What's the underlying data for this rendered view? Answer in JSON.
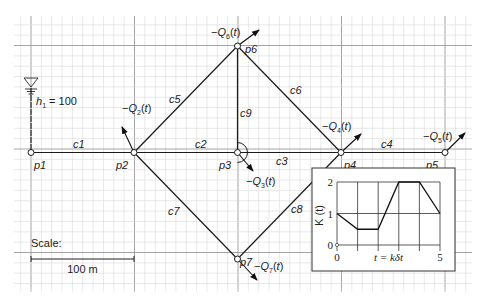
{
  "grid": {
    "x_start": 14,
    "x_end": 472,
    "y_start": 16,
    "y_end": 292,
    "minor": 10.35,
    "major_every": 10,
    "major_origin_x": 31,
    "major_origin_y": 45.5,
    "minor_color": "#d9d9d9",
    "major_color": "#9a9a9a"
  },
  "nodes": [
    {
      "id": "p1",
      "label": "p1",
      "x": 31,
      "y": 152.5,
      "lx": 34,
      "ly": 166
    },
    {
      "id": "p2",
      "label": "p2",
      "x": 134,
      "y": 152.5,
      "lx": 116,
      "ly": 166
    },
    {
      "id": "p3",
      "label": "p3",
      "x": 237.5,
      "y": 152.5,
      "lx": 219,
      "ly": 166
    },
    {
      "id": "p4",
      "label": "p4",
      "x": 341,
      "y": 152.5,
      "lx": 344,
      "ly": 166
    },
    {
      "id": "p5",
      "label": "p5",
      "x": 445,
      "y": 152.5,
      "lx": 426,
      "ly": 166
    },
    {
      "id": "p6",
      "label": "p6",
      "x": 237.5,
      "y": 46,
      "lx": 245,
      "ly": 50
    },
    {
      "id": "p7",
      "label": "p7",
      "x": 237.5,
      "y": 259,
      "lx": 240,
      "ly": 263
    }
  ],
  "pipes": [
    {
      "id": "c1",
      "label": "c1",
      "from": "p1",
      "to": "p2",
      "lx": 73,
      "ly": 148
    },
    {
      "id": "c2",
      "label": "c2",
      "from": "p2",
      "to": "p3",
      "lx": 195,
      "ly": 148
    },
    {
      "id": "c3",
      "label": "c3",
      "from": "p3",
      "to": "p4",
      "lx": 276,
      "ly": 165
    },
    {
      "id": "c4",
      "label": "c4",
      "from": "p4",
      "to": "p5",
      "lx": 381,
      "ly": 148
    },
    {
      "id": "c5",
      "label": "c5",
      "from": "p2",
      "to": "p6",
      "lx": 169,
      "ly": 103
    },
    {
      "id": "c6",
      "label": "c6",
      "from": "p6",
      "to": "p4",
      "lx": 290,
      "ly": 94
    },
    {
      "id": "c7",
      "label": "c7",
      "from": "p2",
      "to": "p7",
      "lx": 168,
      "ly": 215
    },
    {
      "id": "c8",
      "label": "c8",
      "from": "p7",
      "to": "p4",
      "lx": 291,
      "ly": 213
    },
    {
      "id": "c9",
      "label": "c9",
      "from": "p6",
      "to": "p3",
      "lx": 240,
      "ly": 117
    }
  ],
  "demands": [
    {
      "id": "Q2",
      "label_prefix": "−Q",
      "sub": "2",
      "suffix": "(t)",
      "x1": 134,
      "y1": 152.5,
      "x2": 122,
      "y2": 127,
      "lx": 122,
      "ly": 103
    },
    {
      "id": "Q3",
      "label_prefix": "−Q",
      "sub": "3",
      "suffix": "(t)",
      "x1": 237.5,
      "y1": 152.5,
      "x2": 253,
      "y2": 171,
      "lx": 246,
      "ly": 176
    },
    {
      "id": "Q4",
      "label_prefix": "−Q",
      "sub": "4",
      "suffix": "(t)",
      "x1": 341,
      "y1": 152.5,
      "x2": 361,
      "y2": 134,
      "lx": 322,
      "ly": 121
    },
    {
      "id": "Q5",
      "label_prefix": "−Q",
      "sub": "5",
      "suffix": "(t)",
      "x1": 445,
      "y1": 152.5,
      "x2": 465,
      "y2": 133,
      "lx": 423,
      "ly": 131
    },
    {
      "id": "Q6",
      "label_prefix": "−Q",
      "sub": "6",
      "suffix": "(t)",
      "x1": 237.5,
      "y1": 46,
      "x2": 259,
      "y2": 30,
      "lx": 211,
      "ly": 27
    },
    {
      "id": "Q7",
      "label_prefix": "−Q",
      "sub": "7",
      "suffix": "(t)",
      "x1": 237.5,
      "y1": 259,
      "x2": 257,
      "y2": 280,
      "lx": 254,
      "ly": 261
    }
  ],
  "reservoir": {
    "label_h": "h",
    "label_sub": "1",
    "label_value": " = 100",
    "x": 31,
    "y_top": 78,
    "lx": 36,
    "ly": 102
  },
  "scale": {
    "title": "Scale:",
    "length_label": "100 m",
    "x1": 31,
    "x2": 134,
    "y": 259
  },
  "inset": {
    "box": {
      "x": 312,
      "y": 168,
      "w": 143,
      "h": 103
    },
    "plot": {
      "x0": 337,
      "x1": 440,
      "y0": 245,
      "y2": 182
    },
    "ylabel": "K (t)",
    "xlabel": "t = kδt",
    "x_ticks": [
      "0",
      "5"
    ],
    "y_ticks": [
      "0",
      "1",
      "2"
    ]
  },
  "chart_data": {
    "type": "line",
    "title": "",
    "xlabel": "t = kδt",
    "ylabel": "K (t)",
    "x": [
      0,
      1,
      2,
      3,
      4,
      5
    ],
    "series": [
      {
        "name": "K(t)",
        "values": [
          1,
          0.5,
          0.5,
          2,
          2,
          1
        ]
      }
    ],
    "xlim": [
      0,
      5
    ],
    "ylim": [
      0,
      2
    ],
    "x_tick_labels": [
      "0",
      "5"
    ],
    "y_tick_labels": [
      "0",
      "1",
      "2"
    ],
    "grid": true
  }
}
